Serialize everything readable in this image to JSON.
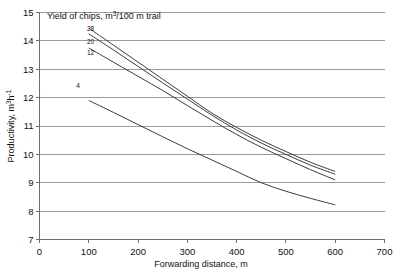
{
  "chart_data": {
    "type": "line",
    "title": "",
    "legend_title": "Yield of chips,  m³/100 m trail",
    "legend_title_parts": {
      "pre": "Yield of chips,  m",
      "sup": "3",
      "post": "/100 m trail"
    },
    "xlabel": "Forwarding distance, m",
    "ylabel": "Productivity, m³·h⁻¹",
    "ylabel_parts": {
      "pre": "Productivity, m",
      "sup": "3",
      "mid": "h",
      "sup2": "-1"
    },
    "xlim": [
      0,
      700
    ],
    "ylim": [
      7,
      15
    ],
    "xticks": [
      0,
      100,
      200,
      300,
      400,
      500,
      600,
      700
    ],
    "xtick_labels": [
      "0",
      "100",
      "200",
      "300",
      "400",
      "500",
      "600",
      "700"
    ],
    "yticks": [
      7,
      8,
      9,
      10,
      11,
      12,
      13,
      14,
      15
    ],
    "ytick_labels": [
      "7",
      "8",
      "9",
      "10",
      "11",
      "12",
      "13",
      "14",
      "15"
    ],
    "grid": "horizontal",
    "legend_position": "inline-left-labels",
    "x": [
      100,
      150,
      200,
      250,
      300,
      350,
      400,
      450,
      500,
      550,
      600
    ],
    "series": [
      {
        "name": "28",
        "label": "28",
        "values": [
          14.45,
          13.85,
          13.25,
          12.65,
          12.05,
          11.45,
          10.95,
          10.5,
          10.1,
          9.72,
          9.4
        ]
      },
      {
        "name": "20",
        "label": "20",
        "values": [
          14.25,
          13.68,
          13.1,
          12.52,
          11.95,
          11.38,
          10.86,
          10.4,
          10.0,
          9.62,
          9.3
        ]
      },
      {
        "name": "12",
        "label": "12",
        "values": [
          13.75,
          13.25,
          12.75,
          12.25,
          11.72,
          11.2,
          10.7,
          10.25,
          9.85,
          9.46,
          9.1
        ]
      },
      {
        "name": "4",
        "label": "4",
        "values": [
          11.9,
          11.48,
          11.05,
          10.62,
          10.2,
          9.8,
          9.4,
          9.0,
          8.7,
          8.45,
          8.22
        ]
      }
    ],
    "series_label_positions": [
      {
        "label": "28",
        "px": 0.148,
        "py": 14.35
      },
      {
        "label": "20",
        "px": 0.148,
        "py": 13.9
      },
      {
        "label": "12",
        "px": 0.148,
        "py": 13.5
      },
      {
        "label": "4",
        "px": 0.112,
        "py": 12.35
      }
    ],
    "colors": {
      "line": "#3c3c3c",
      "grid": "#9a9a9a",
      "axis": "#6e6e6e",
      "text": "#111111",
      "background": "#ffffff"
    }
  }
}
